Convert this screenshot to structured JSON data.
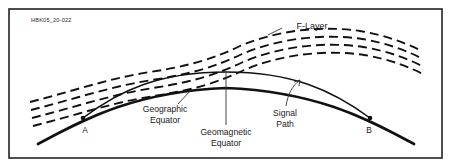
{
  "figure": {
    "id_code": "HBK05_20-022",
    "border_color": "#222222",
    "background_color": "#ffffff",
    "ink_color": "#111111"
  },
  "labels": {
    "flayer": "F-Layer",
    "geographic_equator_line1": "Geographic",
    "geographic_equator_line2": "Equator",
    "geomagnetic_equator_line1": "Geomagnetic",
    "geomagnetic_equator_line2": "Equator",
    "signal_path_line1": "Signal",
    "signal_path_line2": "Path",
    "point_a": "A",
    "point_b": "B"
  },
  "diagram_data": {
    "type": "technical-illustration",
    "subject": "HF radio signal path over the geomagnetic equator through the ionospheric F-Layer",
    "elements": [
      {
        "name": "earth-arc",
        "style": "thick solid curve",
        "description": "Curved surface of the Earth along the geographic equator"
      },
      {
        "name": "signal-path-arc",
        "style": "thin solid curve",
        "description": "Radio signal path arcing from point A to point B above the Earth surface"
      },
      {
        "name": "f-layer-bands",
        "style": "dashed curves",
        "count": 4,
        "description": "Stratified ionospheric F-Layer bands rising from lower-left to upper-center then descending to lower-right"
      }
    ],
    "endpoints": [
      {
        "label": "A",
        "role": "transmitter",
        "x": 83,
        "y": 118
      },
      {
        "label": "B",
        "role": "receiver",
        "x": 370,
        "y": 118
      }
    ]
  }
}
